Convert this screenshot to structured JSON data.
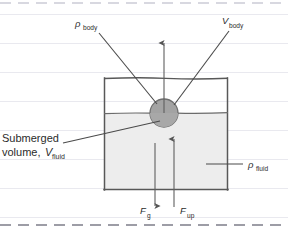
{
  "figure": {
    "colors": {
      "ink": "#2b2b2b",
      "sphere_fill": "#9e9e9e",
      "sphere_stroke": "#6f6f6f",
      "fluid_fill": "#ededed",
      "container_stroke": "#555555",
      "ruled_line": "#e8e8ee",
      "dashed_edge": "#b9b9c2",
      "page_bg": "#ffffff"
    },
    "labels": {
      "rho_body": {
        "symbol": "ρ",
        "subscript": "body"
      },
      "v_body": {
        "symbol": "V",
        "subscript": "body"
      },
      "rho_fluid": {
        "symbol": "ρ",
        "subscript": "fluid"
      },
      "submerged_volume": {
        "line1": "Submerged",
        "line2_prefix": "volume,",
        "line2_symbol": "V",
        "line2_subscript": "fluid"
      },
      "force_gravity": {
        "symbol": "F",
        "subscript": "g"
      },
      "force_up": {
        "symbol": "F",
        "subscript": "up"
      }
    },
    "arrows": {
      "up_top": {
        "direction": "up",
        "name": "buoyant-direction-arrow"
      },
      "f_gravity": {
        "direction": "down",
        "name": "gravity-force-arrow"
      },
      "f_up": {
        "direction": "up",
        "name": "buoyant-force-arrow"
      }
    },
    "geometry": {
      "container": {
        "x": 104,
        "y": 78,
        "width": 124,
        "height": 112
      },
      "fluid_surface_y": 113,
      "sphere": {
        "cx": 164,
        "cy": 113,
        "r": 14
      }
    },
    "ruled_lines_y": [
      14,
      43,
      72,
      101,
      130,
      159,
      188,
      217
    ],
    "dashed_edges_y": [
      3,
      225
    ]
  }
}
